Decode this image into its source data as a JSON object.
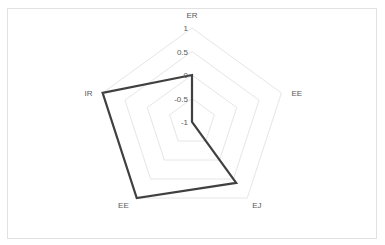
{
  "chart_data": {
    "type": "radar",
    "title": "",
    "categories": [
      "ER",
      "EE",
      "EJ",
      "EE",
      "IR"
    ],
    "series": [
      {
        "name": "Series1",
        "values": [
          0,
          -1,
          0.6,
          1,
          1
        ],
        "color": "#404040"
      }
    ],
    "rlim": [
      -1,
      1
    ],
    "ticks": [
      "1",
      "0.5",
      "0",
      "-0.5",
      "-1"
    ],
    "grid": true,
    "legend": "none"
  },
  "axis_labels": [
    "ER",
    "EE",
    "EJ",
    "EE",
    "IR"
  ],
  "tick_labels": [
    "1",
    "0.5",
    "0",
    "-0.5",
    "-1"
  ]
}
